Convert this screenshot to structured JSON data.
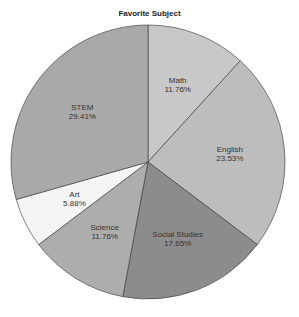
{
  "chart_data": {
    "type": "pie",
    "title": "Favorite Subject",
    "start_angle": "12 o'clock, clockwise",
    "categories": [
      "Math",
      "English",
      "Social Studies",
      "Science",
      "Art",
      "STEM"
    ],
    "values": [
      11.76,
      23.53,
      17.65,
      11.76,
      5.88,
      29.41
    ],
    "labels": [
      "11.76%",
      "23.53%",
      "17.65%",
      "11.76%",
      "5.88%",
      "29.41%"
    ],
    "colors": [
      "#c8c8c8",
      "#bdbdbd",
      "#8c8c8c",
      "#adadad",
      "#f5f5f5",
      "#a9a9a9"
    ],
    "legend": "none",
    "edge_color": "#333333"
  }
}
